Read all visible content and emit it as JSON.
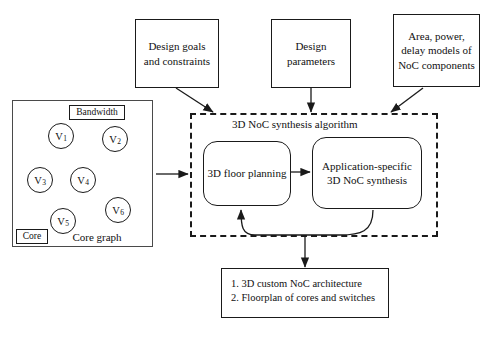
{
  "diagram": {
    "inputs": [
      {
        "id": "design-goals",
        "label": "Design goals\nand constraints"
      },
      {
        "id": "design-parameters",
        "label": "Design\nparameters"
      },
      {
        "id": "noc-models",
        "label": "Area, power,\ndelay models of\nNoC components"
      }
    ],
    "core_graph_panel": {
      "caption": "Core graph",
      "bandwidth_label": "Bandwidth",
      "core_label": "Core",
      "nodes": [
        {
          "id": "v1",
          "label": "V",
          "sub": "1",
          "x": 60,
          "y": 135
        },
        {
          "id": "v2",
          "label": "V",
          "sub": "2",
          "x": 114,
          "y": 138
        },
        {
          "id": "v3",
          "label": "V",
          "sub": "3",
          "x": 39,
          "y": 179
        },
        {
          "id": "v4",
          "label": "V",
          "sub": "4",
          "x": 82,
          "y": 179
        },
        {
          "id": "v5",
          "label": "V",
          "sub": "5",
          "x": 62,
          "y": 220
        },
        {
          "id": "v6",
          "label": "V",
          "sub": "6",
          "x": 117,
          "y": 209
        }
      ],
      "edges": [
        {
          "from": "v1",
          "to": "v2"
        },
        {
          "from": "v1",
          "to": "v3"
        },
        {
          "from": "v1",
          "to": "v4"
        },
        {
          "from": "v2",
          "to": "v6"
        },
        {
          "from": "v3",
          "to": "v5"
        },
        {
          "from": "v4",
          "to": "v5"
        },
        {
          "from": "v4",
          "to": "v6"
        },
        {
          "from": "v5",
          "to": "v1"
        }
      ]
    },
    "algorithm": {
      "title": "3D NoC synthesis algorithm",
      "stages": [
        {
          "id": "floor-planning",
          "label": "3D floor planning"
        },
        {
          "id": "noc-synthesis",
          "label": "Application-specific\n3D NoC synthesis"
        }
      ],
      "feedback": true
    },
    "output": {
      "lines": [
        "1. 3D custom NoC architecture",
        "2. Floorplan of cores and switches"
      ]
    },
    "colors": {
      "stroke": "#1a1a1a",
      "panel_stroke": "#4a4a4a",
      "background": "#ffffff"
    }
  }
}
